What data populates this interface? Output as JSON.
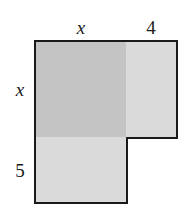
{
  "diagram": {
    "colors": {
      "square_fill": "#c4c4c4",
      "rect_right_fill": "#dadada",
      "rect_bottom_fill": "#dadada",
      "border": "#1a1a1a"
    },
    "regions": {
      "square": {
        "width_label": "x",
        "height_label": "x"
      },
      "right_rect": {
        "width_label": "4",
        "height_label": "x"
      },
      "bottom_rect": {
        "width_label": "x",
        "height_label": "5"
      }
    },
    "labels": {
      "top_x": "x",
      "top_4": "4",
      "left_x": "x",
      "left_5": "5"
    }
  }
}
